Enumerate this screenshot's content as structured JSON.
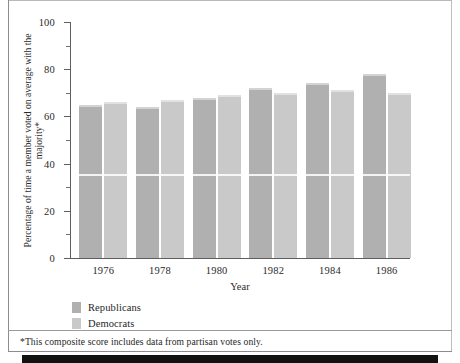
{
  "chart_data": {
    "type": "bar",
    "title": "",
    "subtitle": "",
    "xlabel": "Year",
    "ylabel": "Percentage of time a member voted on average with the majority*",
    "categories": [
      "1976",
      "1978",
      "1980",
      "1982",
      "1984",
      "1986"
    ],
    "series": [
      {
        "name": "Republicans",
        "color": "#b0b0b0",
        "values": [
          65,
          64,
          68,
          72,
          74,
          78
        ]
      },
      {
        "name": "Democrats",
        "color": "#c9c9c9",
        "values": [
          66,
          67,
          69,
          70,
          71,
          70
        ]
      }
    ],
    "ylim": [
      0,
      100
    ],
    "ytick_labels": [
      "0",
      "20",
      "40",
      "60",
      "80",
      "100"
    ],
    "ytick_values": [
      0,
      20,
      40,
      60,
      80,
      100
    ],
    "yminor_values": [
      10,
      30,
      50,
      70,
      90
    ],
    "grid": false,
    "legend_position": "bottom-left"
  },
  "legend": {
    "items": [
      {
        "label": "Republicans",
        "color": "#b0b0b0"
      },
      {
        "label": "Democrats",
        "color": "#c9c9c9"
      }
    ]
  },
  "footnote": {
    "text": "*This composite score includes data from partisan votes only."
  }
}
